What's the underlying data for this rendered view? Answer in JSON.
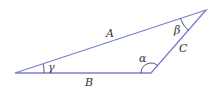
{
  "diagram": {
    "type": "triangle",
    "stroke_color": "#7b7fd0",
    "label_color": "#333333",
    "vertices": {
      "left": [
        15,
        73
      ],
      "bottom_right": [
        151,
        73
      ],
      "top_right": [
        206,
        10
      ]
    },
    "sides": {
      "A": {
        "label": "A",
        "from": "left",
        "to": "top_right"
      },
      "B": {
        "label": "B",
        "from": "left",
        "to": "bottom_right"
      },
      "C": {
        "label": "C",
        "from": "bottom_right",
        "to": "top_right"
      }
    },
    "angles": {
      "alpha": {
        "label": "α",
        "vertex": "bottom_right"
      },
      "beta": {
        "label": "β",
        "vertex": "top_right"
      },
      "gamma": {
        "label": "γ",
        "vertex": "left"
      }
    }
  }
}
